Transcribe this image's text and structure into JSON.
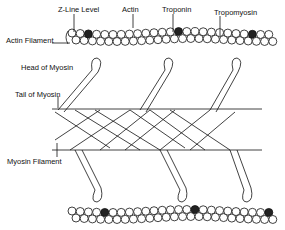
{
  "diagram": {
    "labels": {
      "z_line": "Z-Line Level",
      "actin": "Actin",
      "troponin": "Troponin",
      "tropomyosin": "Tropomyosin",
      "actin_filament": "Actin Filament",
      "head_of_myosin": "Head of Myosin",
      "tail_of_myosin": "Tail of Myosin",
      "myosin_filament": "Myosin Filament"
    },
    "colors": {
      "line": "#111111",
      "background": "#ffffff"
    }
  }
}
